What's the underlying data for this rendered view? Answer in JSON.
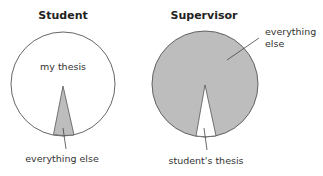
{
  "diagram": {
    "student": {
      "title": "Student",
      "main_label": "my thesis",
      "slice_label": "everything else",
      "main_fill": "#ffffff",
      "slice_fill": "#bdbdbd"
    },
    "supervisor": {
      "title": "Supervisor",
      "main_label_line1": "everything",
      "main_label_line2": "else",
      "slice_label": "student's thesis",
      "main_fill": "#bdbdbd",
      "slice_fill": "#ffffff"
    }
  }
}
